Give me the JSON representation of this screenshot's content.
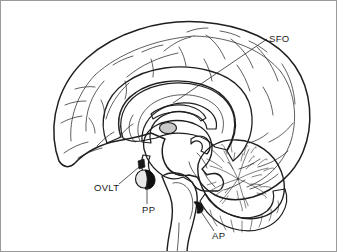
{
  "figure": {
    "name": "midsagittal-brain-circumventricular-organs",
    "border_color": "#9a9a9a",
    "background_color": "#ffffff"
  },
  "palette": {
    "outline": "#1e1e1e",
    "cortex_fill": "#fdfdfd",
    "deep_gray": "#b4b4b4",
    "mid_gray": "#c3c3c3",
    "dark_structure": "#111111",
    "cerebellum_fill": "#fbfbfb",
    "tonsil_gray": "#bdbdbd",
    "label_color": "#1a1a1a"
  },
  "labels": [
    {
      "id": "sfo",
      "text": "SFO",
      "meaning": "subfornical-organ",
      "x": 268,
      "y": 41,
      "anchor": "start",
      "leader": "M 266 38 L 172 102"
    },
    {
      "id": "ovlt",
      "text": "OVLT",
      "meaning": "organum-vasculosum-of-the-lamina-terminalis",
      "x": 93,
      "y": 190,
      "anchor": "start",
      "leader": "M 118 183 L 138 166"
    },
    {
      "id": "pp",
      "text": "PP",
      "meaning": "posterior-pituitary",
      "x": 141,
      "y": 212,
      "anchor": "start",
      "leader": "M 146 203 L 146 180"
    },
    {
      "id": "ap",
      "text": "AP",
      "meaning": "area-postrema",
      "x": 211,
      "y": 238,
      "anchor": "start",
      "leader": "M 213 230 L 199 209"
    }
  ],
  "structures": [
    {
      "id": "cerebral-cortex",
      "label": "cerebral cortex"
    },
    {
      "id": "corpus-callosum",
      "label": "corpus callosum"
    },
    {
      "id": "thalamus",
      "label": "thalamus"
    },
    {
      "id": "massa-intermedia",
      "label": "massa intermedia"
    },
    {
      "id": "brainstem",
      "label": "brainstem"
    },
    {
      "id": "cerebellum",
      "label": "cerebellum"
    },
    {
      "id": "pituitary",
      "label": "pituitary gland"
    }
  ]
}
